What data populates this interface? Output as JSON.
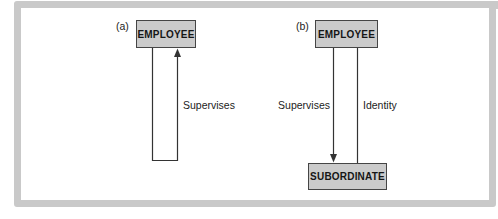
{
  "figure": {
    "kind": "entity-relationship-diagram",
    "frame_color": "#c9c9c9",
    "entity_fill": "#cbcbcb",
    "entity_border": "#454545",
    "line_color": "#333333"
  },
  "panel_a": {
    "label": "(a)",
    "entity": "EMPLOYEE",
    "relationship": "Supervises",
    "relationship_type": "recursive-loop"
  },
  "panel_b": {
    "label": "(b)",
    "entity_top": "EMPLOYEE",
    "entity_bottom": "SUBORDINATE",
    "relationship_supervises": "Supervises",
    "relationship_identity": "Identity"
  }
}
